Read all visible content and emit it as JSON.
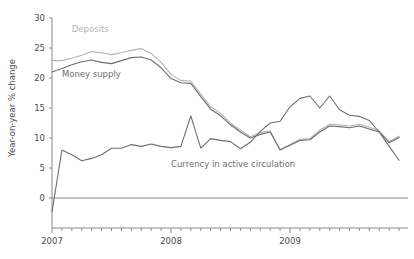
{
  "chart_data": {
    "type": "line",
    "title": "",
    "subtitle": "",
    "xlabel": "",
    "ylabel": "Year-on-year % change",
    "ylim": [
      -4,
      30
    ],
    "yticks": [
      0,
      5,
      10,
      15,
      20,
      25,
      30
    ],
    "ytick_labels": [
      "0",
      "5",
      "10",
      "15",
      "20",
      "25",
      "30"
    ],
    "xlim": [
      "2007-01",
      "2009-12"
    ],
    "xtick_labels": [
      "2007",
      "2008",
      "2009"
    ],
    "xtick_positions": [
      0,
      12,
      24
    ],
    "x_minor_ticks": "monthly",
    "grid": false,
    "legend_position": "inline-annotations",
    "zero_reference_line": true,
    "x": [
      "2007-01",
      "2007-02",
      "2007-03",
      "2007-04",
      "2007-05",
      "2007-06",
      "2007-07",
      "2007-08",
      "2007-09",
      "2007-10",
      "2007-11",
      "2007-12",
      "2008-01",
      "2008-02",
      "2008-03",
      "2008-04",
      "2008-05",
      "2008-06",
      "2008-07",
      "2008-08",
      "2008-09",
      "2008-10",
      "2008-11",
      "2008-12",
      "2009-01",
      "2009-02",
      "2009-03",
      "2009-04",
      "2009-05",
      "2009-06",
      "2009-07",
      "2009-08",
      "2009-09",
      "2009-10",
      "2009-11",
      "2009-12"
    ],
    "series": [
      {
        "name": "Deposits",
        "color": "#b3b3b3",
        "label_x": "2007-03",
        "label_y": 27.6,
        "values": [
          22.9,
          22.9,
          23.3,
          23.8,
          24.4,
          24.2,
          23.9,
          24.2,
          24.6,
          24.9,
          24.1,
          22.6,
          20.6,
          19.6,
          19.5,
          17.3,
          15.2,
          14.1,
          12.5,
          11.3,
          10.2,
          10.9,
          11.2,
          8.1,
          8.9,
          9.8,
          9.9,
          11.3,
          12.3,
          12.2,
          12.0,
          12.3,
          11.8,
          11.2,
          9.4,
          10.3
        ]
      },
      {
        "name": "Money supply",
        "color": "#6e6e6e",
        "label_x": "2007-02",
        "label_y": 20.2,
        "values": [
          21.0,
          21.6,
          22.2,
          22.7,
          23.0,
          22.6,
          22.4,
          22.9,
          23.4,
          23.5,
          23.0,
          21.7,
          19.9,
          19.2,
          19.1,
          16.9,
          14.8,
          13.7,
          12.2,
          11.0,
          10.0,
          10.6,
          11.0,
          8.0,
          8.8,
          9.6,
          9.7,
          11.0,
          12.0,
          11.9,
          11.7,
          12.0,
          11.5,
          11.0,
          9.2,
          10.1
        ]
      },
      {
        "name": "Currency in active circulation",
        "color": "#6e6e6e",
        "label_x": "2008-01",
        "label_y": 5.2,
        "values": [
          -2.3,
          8.0,
          7.2,
          6.2,
          6.6,
          7.2,
          8.3,
          8.3,
          8.9,
          8.6,
          9.0,
          8.6,
          8.4,
          8.6,
          13.7,
          8.3,
          9.9,
          9.6,
          9.4,
          8.2,
          9.3,
          11.1,
          12.5,
          12.8,
          15.2,
          16.6,
          17.0,
          15.0,
          17.0,
          14.7,
          13.8,
          13.6,
          12.9,
          11.0,
          8.6,
          6.3
        ]
      }
    ]
  }
}
